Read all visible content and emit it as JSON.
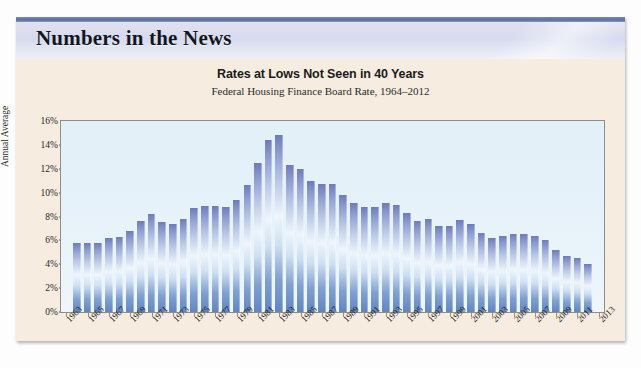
{
  "header": {
    "section_title": "Numbers in the News"
  },
  "chart_data": {
    "type": "bar",
    "title": "Rates at Lows Not Seen in 40 Years",
    "subtitle": "Federal Housing Finance Board Rate, 1964–2012",
    "xlabel": "",
    "ylabel": "Annual Average",
    "ylim": [
      0,
      16
    ],
    "ytick_labels": [
      "16%",
      "14%",
      "12%",
      "10%",
      "8%",
      "6%",
      "4%",
      "2%",
      "0%"
    ],
    "ytick_values": [
      16,
      14,
      12,
      10,
      8,
      6,
      4,
      2,
      0
    ],
    "grid": false,
    "legend": "none",
    "x_tick_labels": [
      "1963",
      "1965",
      "1967",
      "1969",
      "1971",
      "1973",
      "1975",
      "1977",
      "1979",
      "1981",
      "1983",
      "1985",
      "1987",
      "1989",
      "1991",
      "1993",
      "1995",
      "1997",
      "1999",
      "2001",
      "2003",
      "2005",
      "2007",
      "2009",
      "2011",
      "2013"
    ],
    "categories": [
      1964,
      1965,
      1966,
      1967,
      1968,
      1969,
      1970,
      1971,
      1972,
      1973,
      1974,
      1975,
      1976,
      1977,
      1978,
      1979,
      1980,
      1981,
      1982,
      1983,
      1984,
      1985,
      1986,
      1987,
      1988,
      1989,
      1990,
      1991,
      1992,
      1993,
      1994,
      1995,
      1996,
      1997,
      1998,
      1999,
      2000,
      2001,
      2002,
      2003,
      2004,
      2005,
      2006,
      2007,
      2008,
      2009,
      2010,
      2011,
      2012
    ],
    "values": [
      5.8,
      5.8,
      5.8,
      6.2,
      6.3,
      6.8,
      7.6,
      8.2,
      7.5,
      7.4,
      7.8,
      8.7,
      8.9,
      8.9,
      8.8,
      9.4,
      10.6,
      12.5,
      14.4,
      14.8,
      12.3,
      12.0,
      11.0,
      10.7,
      10.7,
      9.8,
      9.1,
      8.8,
      8.8,
      9.1,
      9.0,
      8.3,
      7.6,
      7.8,
      7.2,
      7.2,
      7.7,
      7.4,
      6.6,
      6.2,
      6.4,
      6.5,
      6.5,
      6.4,
      6.0,
      5.2,
      4.7,
      4.5,
      4.0
    ],
    "colors": {
      "bar_top": "#6d7bba",
      "bar_mid": "#eef5fc",
      "bar_bottom": "#5f86c4",
      "plot_background": "#e7f2f9",
      "card_background": "#f6ece0",
      "banner": "#dfe2f0",
      "top_rule": "#5d6bae"
    }
  }
}
